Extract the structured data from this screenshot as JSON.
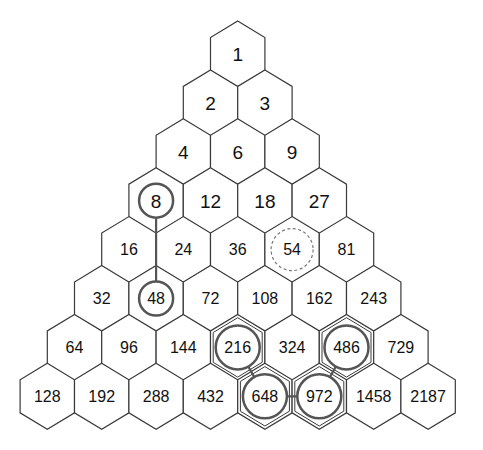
{
  "diagram": {
    "type": "hexagonal-number-pyramid",
    "rows": [
      [
        "1"
      ],
      [
        "2",
        "3"
      ],
      [
        "4",
        "6",
        "9"
      ],
      [
        "8",
        "12",
        "18",
        "27"
      ],
      [
        "16",
        "24",
        "36",
        "54",
        "81"
      ],
      [
        "32",
        "48",
        "72",
        "108",
        "162",
        "243"
      ],
      [
        "64",
        "96",
        "144",
        "216",
        "324",
        "486",
        "729"
      ],
      [
        "128",
        "192",
        "288",
        "432",
        "648",
        "972",
        "1458",
        "2187"
      ]
    ],
    "highlights": {
      "solid_circles": [
        {
          "row": 3,
          "col": 0,
          "value": "8"
        },
        {
          "row": 5,
          "col": 1,
          "value": "48"
        },
        {
          "row": 6,
          "col": 3,
          "value": "216",
          "inner_hex": true
        },
        {
          "row": 6,
          "col": 5,
          "value": "486",
          "inner_hex": true
        },
        {
          "row": 7,
          "col": 4,
          "value": "648",
          "inner_hex": true
        },
        {
          "row": 7,
          "col": 5,
          "value": "972",
          "inner_hex": true
        }
      ],
      "dashed_circles": [
        {
          "row": 4,
          "col": 3,
          "value": "54"
        }
      ],
      "connectors": [
        {
          "from": [
            3,
            0
          ],
          "to": [
            5,
            1
          ]
        },
        {
          "from": [
            6,
            3
          ],
          "to": [
            7,
            4
          ]
        },
        {
          "from": [
            7,
            4
          ],
          "to": [
            7,
            5
          ]
        },
        {
          "from": [
            7,
            5
          ],
          "to": [
            6,
            5
          ]
        }
      ]
    },
    "colors": {
      "hex_stroke": "#3a3a3a",
      "circle_stroke": "#555555",
      "dashed_stroke": "#777777",
      "text": "#111111",
      "background": "#ffffff"
    }
  }
}
